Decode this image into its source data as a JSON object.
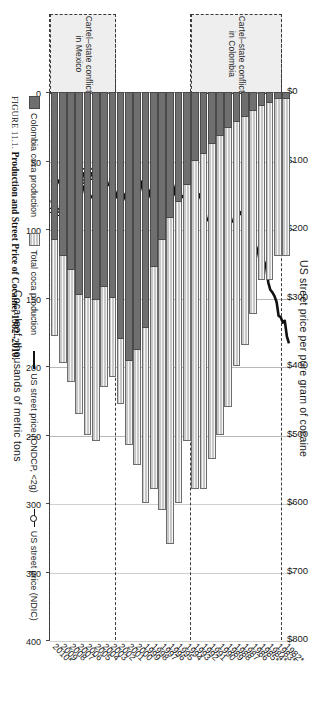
{
  "figure": {
    "caption_label": "FIGURE 11.1.",
    "caption_text": "Production and Street Price of Cocaine, 1982–2010."
  },
  "axes": {
    "price_axis_title": "US street price per pure gram of cocaine",
    "price_ticks": [
      "$0",
      "$100",
      "$200",
      "$300",
      "$400",
      "$500",
      "$600",
      "$700",
      "$800"
    ],
    "production_axis_title": "Coca leaf, thousands of metric tons",
    "production_ticks": [
      "0",
      "50",
      "100",
      "150",
      "200",
      "250",
      "300",
      "350",
      "400"
    ]
  },
  "legend": {
    "items": [
      {
        "label": "Colombia coca production",
        "marker": "swatch-dark"
      },
      {
        "label": "Total coca production",
        "marker": "swatch-light"
      },
      {
        "label": "US street price (ONDCP, <2g)",
        "marker": "line-solid"
      },
      {
        "label": "US street price (NDIC)",
        "marker": "line-dotted"
      }
    ]
  },
  "annotations": [
    {
      "name": "cartel-state-conflict-colombia",
      "label": "Cartel–state conflict\nin Colombia",
      "start_year": 1983,
      "end_year": 1993
    },
    {
      "name": "cartel-state-conflict-mexico",
      "label": "Cartel–state conflict\nin Mexico",
      "start_year": 2003,
      "end_year": 2010
    }
  ],
  "chart_data": {
    "type": "bar",
    "title": "Production and Street Price of Cocaine, 1982–2010",
    "orientation": "horizontal",
    "xlabel": "Coca leaf, thousands of metric tons",
    "ylabel": "US street price per pure gram of cocaine",
    "xlim": [
      0,
      400
    ],
    "price_lim": [
      0,
      800
    ],
    "grid": true,
    "legend_position": "bottom",
    "categories": [
      "1982*",
      "1983*",
      "1984*",
      "1985*",
      "1986",
      "1987",
      "1988",
      "1989",
      "1990",
      "1991",
      "1992",
      "1993",
      "1994",
      "1995",
      "1996",
      "1997",
      "1998",
      "1999",
      "2000",
      "2001",
      "2002",
      "2003",
      "2004",
      "2005",
      "2006",
      "2007",
      "2008",
      "2009",
      "2010*"
    ],
    "series": [
      {
        "name": "Total coca production",
        "unit": "thousands of metric tons of coca leaf",
        "values": [
          120,
          120,
          137,
          137,
          162,
          185,
          200,
          230,
          250,
          268,
          290,
          290,
          255,
          300,
          330,
          305,
          290,
          300,
          272,
          258,
          228,
          208,
          215,
          255,
          250,
          235,
          212,
          198,
          178
        ]
      },
      {
        "name": "Colombia coca production",
        "unit": "thousands of metric tons of coca leaf",
        "values": [
          5,
          5,
          8,
          10,
          14,
          18,
          22,
          26,
          32,
          38,
          45,
          50,
          68,
          80,
          92,
          108,
          128,
          172,
          188,
          196,
          180,
          150,
          142,
          152,
          150,
          148,
          130,
          120,
          108
        ]
      },
      {
        "name": "US street price (ONDCP, <2g)",
        "unit": "US dollars per pure gram",
        "values": [
          370,
          330,
          300,
          255,
          228,
          205,
          170,
          195,
          168,
          160,
          185,
          145,
          150,
          160,
          145,
          150,
          140,
          148,
          140,
          160,
          152,
          145,
          130,
          148,
          160,
          138,
          142,
          140,
          132
        ]
      },
      {
        "name": "US street price (NDIC)",
        "unit": "US dollars per pure gram",
        "values": [
          null,
          null,
          null,
          null,
          null,
          null,
          null,
          null,
          null,
          null,
          null,
          null,
          null,
          null,
          null,
          null,
          null,
          null,
          null,
          null,
          null,
          null,
          null,
          120,
          118,
          126,
          158,
          168,
          170
        ]
      }
    ]
  }
}
